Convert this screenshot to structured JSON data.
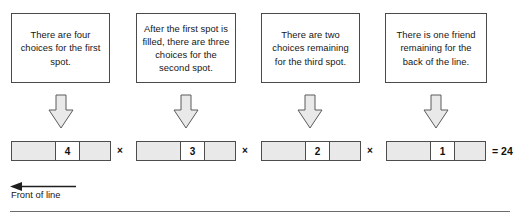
{
  "diagram": {
    "captions": [
      {
        "id": "caption-1",
        "text": "There are four choices for the first spot."
      },
      {
        "id": "caption-2",
        "text": "After the first spot is filled, there are three choices for the second spot."
      },
      {
        "id": "caption-3",
        "text": "There are two choices remaining for the third spot."
      },
      {
        "id": "caption-4",
        "text": "There is one friend remaining for the back of the line."
      }
    ],
    "arrows": [
      {
        "id": "arrow-1",
        "direction": "down"
      },
      {
        "id": "arrow-2",
        "direction": "down"
      },
      {
        "id": "arrow-3",
        "direction": "down"
      },
      {
        "id": "arrow-4",
        "direction": "down"
      }
    ],
    "bars": [
      {
        "id": "bar-1",
        "count": "4"
      },
      {
        "id": "bar-2",
        "count": "3"
      },
      {
        "id": "bar-3",
        "count": "2"
      },
      {
        "id": "bar-4",
        "count": "1"
      }
    ],
    "operators": [
      "×",
      "×",
      "×"
    ],
    "result": "= 24",
    "front_of_line": {
      "label": "Front of line",
      "arrow_direction": "left"
    },
    "colors": {
      "seat_fill": "#e9e9e9",
      "stroke": "#4d4d4d",
      "text": "#161616",
      "rule": "#6b6b6b"
    }
  }
}
